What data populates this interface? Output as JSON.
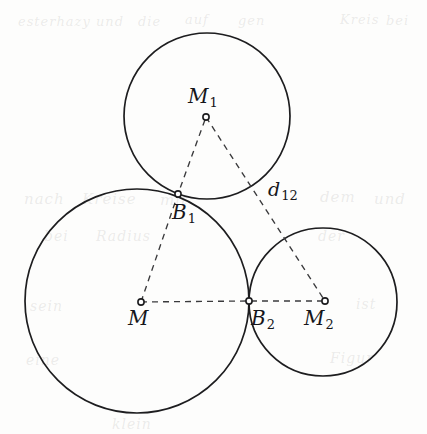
{
  "figure": {
    "kind": "geometry-diagram",
    "canvas": {
      "width": 427,
      "height": 434
    },
    "stroke_color": "#1d1d1f",
    "dash_color": "#3a3a3c",
    "background_color": "#fdfdfc"
  },
  "circles": [
    {
      "name": "circle-M",
      "center_label": "M",
      "cx": 137,
      "cy": 301,
      "r": 112
    },
    {
      "name": "circle-M1",
      "center_label": "M1",
      "cx": 207,
      "cy": 116,
      "r": 83
    },
    {
      "name": "circle-M2",
      "center_label": "M2",
      "cx": 323,
      "cy": 302,
      "r": 74
    }
  ],
  "points": [
    {
      "name": "M",
      "x": 141,
      "y": 302,
      "label": "M",
      "sub": ""
    },
    {
      "name": "M1",
      "x": 206,
      "y": 117,
      "label": "M",
      "sub": "1"
    },
    {
      "name": "M2",
      "x": 325,
      "y": 301,
      "label": "M",
      "sub": "2"
    },
    {
      "name": "B1",
      "x": 178,
      "y": 194,
      "label": "B",
      "sub": "1"
    },
    {
      "name": "B2",
      "x": 249,
      "y": 301,
      "label": "B",
      "sub": "2"
    }
  ],
  "segments": [
    {
      "name": "segment-M-B1-M1",
      "path": "M 141 302 L 178 194 L 206 117",
      "label": ""
    },
    {
      "name": "segment-M-B2-M2",
      "path": "M 141 302 L 249 301 L 325 301",
      "label": ""
    },
    {
      "name": "segment-M1-M2",
      "path": "M 206 117 L 325 301",
      "label": "d12"
    }
  ],
  "labels": {
    "M": {
      "base": "M",
      "sub": ""
    },
    "M1": {
      "base": "M",
      "sub": "1"
    },
    "M2": {
      "base": "M",
      "sub": "2"
    },
    "B1": {
      "base": "B",
      "sub": "1"
    },
    "B2": {
      "base": "B",
      "sub": "2"
    },
    "d12": {
      "base": "d",
      "sub": "12"
    }
  },
  "background_bleed": [
    {
      "text": "esterhazy",
      "x": 18,
      "y": 14,
      "size": 13
    },
    {
      "text": "und",
      "x": 96,
      "y": 14,
      "size": 13
    },
    {
      "text": "die",
      "x": 138,
      "y": 14,
      "size": 13
    },
    {
      "text": "auf",
      "x": 185,
      "y": 12,
      "size": 13
    },
    {
      "text": "gen",
      "x": 238,
      "y": 13,
      "size": 13
    },
    {
      "text": "Kreis",
      "x": 340,
      "y": 12,
      "size": 13
    },
    {
      "text": "bei",
      "x": 386,
      "y": 13,
      "size": 13
    },
    {
      "text": "nach",
      "x": 24,
      "y": 190,
      "size": 15
    },
    {
      "text": "Kreise",
      "x": 82,
      "y": 190,
      "size": 15
    },
    {
      "text": "mit",
      "x": 160,
      "y": 191,
      "size": 15
    },
    {
      "text": "dem",
      "x": 320,
      "y": 188,
      "size": 15
    },
    {
      "text": "und",
      "x": 374,
      "y": 190,
      "size": 15
    },
    {
      "text": "bei",
      "x": 44,
      "y": 228,
      "size": 14
    },
    {
      "text": "Radius",
      "x": 96,
      "y": 228,
      "size": 14
    },
    {
      "text": "der",
      "x": 318,
      "y": 228,
      "size": 14
    },
    {
      "text": "sein",
      "x": 30,
      "y": 298,
      "size": 14
    },
    {
      "text": "ist",
      "x": 356,
      "y": 296,
      "size": 14
    },
    {
      "text": "eine",
      "x": 26,
      "y": 352,
      "size": 14
    },
    {
      "text": "Figur",
      "x": 330,
      "y": 350,
      "size": 14
    },
    {
      "text": "klein",
      "x": 112,
      "y": 416,
      "size": 14
    }
  ]
}
